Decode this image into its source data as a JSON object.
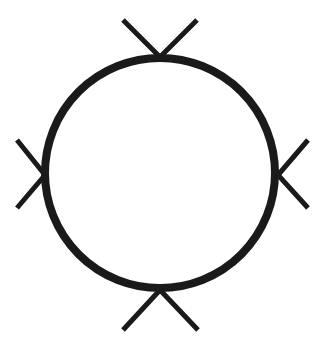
{
  "diagram": {
    "stroke_color": "#1a1a1a",
    "background": "#ffffff",
    "circle": {
      "cx": 160,
      "cy": 173,
      "r": 115,
      "stroke_width": 8
    },
    "ticks": [
      {
        "name": "top",
        "points": "123,20 160,57 197,20"
      },
      {
        "name": "right",
        "points": "308,140 278,175 308,208"
      },
      {
        "name": "bottom",
        "points": "123,330 160,290 198,330"
      },
      {
        "name": "left",
        "points": "17,140 45,175 17,208"
      }
    ]
  }
}
